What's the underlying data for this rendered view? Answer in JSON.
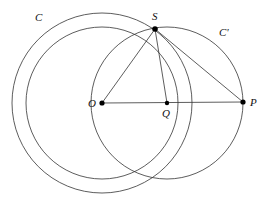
{
  "figure": {
    "kind": "geometry-diagram",
    "background": "#ffffff",
    "stroke_color": "#333333",
    "point_color": "#000000",
    "width": 272,
    "height": 200
  },
  "points": [
    {
      "id": "O",
      "label": "O",
      "x": 102,
      "y": 103,
      "label_x": 88,
      "label_y": 98,
      "dot": true
    },
    {
      "id": "S",
      "label": "S",
      "x": 155,
      "y": 29,
      "label_x": 152,
      "label_y": 11,
      "dot": true
    },
    {
      "id": "Q",
      "label": "Q",
      "x": 167,
      "y": 103,
      "label_x": 162,
      "label_y": 108,
      "dot": true
    },
    {
      "id": "P",
      "label": "P",
      "x": 243,
      "y": 102,
      "label_x": 250,
      "label_y": 97,
      "dot": true
    }
  ],
  "circles": [
    {
      "id": "C",
      "label": "C",
      "cx": 102,
      "cy": 103,
      "r": 90,
      "label_x": 35,
      "label_y": 12
    },
    {
      "id": "Cp",
      "label": "C'",
      "cx": 167,
      "cy": 103,
      "r": 76,
      "label_x": 219,
      "label_y": 27
    },
    {
      "id": "OS",
      "label": "",
      "cx": 102,
      "cy": 103,
      "r": 76,
      "label_x": 0,
      "label_y": 0
    }
  ],
  "segments": [
    {
      "id": "OP",
      "from": "O",
      "to": "P"
    },
    {
      "id": "OS",
      "from": "O",
      "to": "S"
    },
    {
      "id": "SP",
      "from": "S",
      "to": "P"
    },
    {
      "id": "SQ",
      "from": "S",
      "to": "Q"
    }
  ],
  "labels": {
    "circle_c": "C",
    "circle_c_prime": "C'",
    "point_o": "O",
    "point_s": "S",
    "point_q": "Q",
    "point_p": "P"
  }
}
